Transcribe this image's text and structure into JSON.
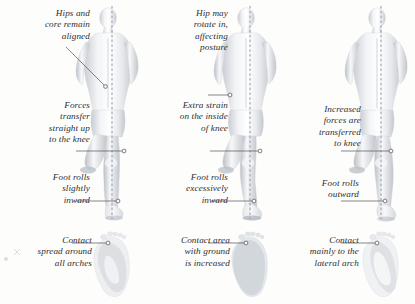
{
  "figure": {
    "background_color": "#fdfdfb",
    "text_color": "#2e2e33",
    "plumb_line_color": "#9aa0ad",
    "leader_line_color": "#53535c",
    "view": "rear view of runner with vertical plumb line"
  },
  "panels": [
    {
      "id": "neutral",
      "figure_label": "runner-rear-view-neutral",
      "footprint_label": "footprint-neutral-arch",
      "callouts": {
        "hip": "Hips and\ncore remain\naligned",
        "force": "Forces\ntransfer\nstraight up\nto the knee",
        "roll": "Foot rolls\nslightly\ninward",
        "contact": "Contact\nspread around\nall arches"
      }
    },
    {
      "id": "overpronation",
      "figure_label": "runner-rear-view-overpronation",
      "footprint_label": "footprint-flat-arch",
      "callouts": {
        "hip": "Hip may\nrotate in,\naffecting\nposture",
        "force": "Extra strain\non the inside\nof knee",
        "roll": "Foot rolls\nexcessively\ninward",
        "contact": "Contact area\nwith ground\nis increased"
      }
    },
    {
      "id": "supination",
      "figure_label": "runner-rear-view-supination",
      "footprint_label": "footprint-high-arch",
      "callouts": {
        "hip": "",
        "force": "Increased\nforces are\ntransferred\nto knee",
        "roll": "Foot rolls\noutward",
        "contact": "Contact\nmainly to the\nlateral arch"
      }
    }
  ]
}
